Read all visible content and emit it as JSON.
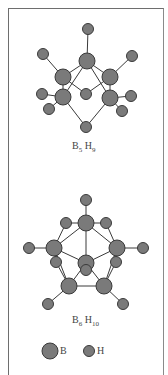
{
  "figure": {
    "molecules": [
      {
        "name": "B5H9",
        "label": {
          "B": "B",
          "B_count": "5",
          "H": "H",
          "H_count": "9"
        },
        "atoms": [
          {
            "el": "H",
            "x": 88,
            "y": 29
          },
          {
            "el": "B",
            "x": 87,
            "y": 61
          },
          {
            "el": "H",
            "x": 43,
            "y": 54
          },
          {
            "el": "H",
            "x": 132,
            "y": 56
          },
          {
            "el": "B",
            "x": 63,
            "y": 77
          },
          {
            "el": "B",
            "x": 110,
            "y": 77
          },
          {
            "el": "H",
            "x": 86,
            "y": 94
          },
          {
            "el": "B",
            "x": 63,
            "y": 97
          },
          {
            "el": "B",
            "x": 110,
            "y": 98
          },
          {
            "el": "H",
            "x": 42,
            "y": 94
          },
          {
            "el": "H",
            "x": 49,
            "y": 109
          },
          {
            "el": "H",
            "x": 131,
            "y": 96
          },
          {
            "el": "H",
            "x": 122,
            "y": 111
          },
          {
            "el": "H",
            "x": 86,
            "y": 127
          }
        ],
        "bonds": [
          [
            0,
            1
          ],
          [
            1,
            4
          ],
          [
            1,
            5
          ],
          [
            1,
            7
          ],
          [
            1,
            8
          ],
          [
            2,
            4
          ],
          [
            3,
            5
          ],
          [
            4,
            6
          ],
          [
            5,
            6
          ],
          [
            4,
            7
          ],
          [
            5,
            8
          ],
          [
            7,
            9
          ],
          [
            7,
            10
          ],
          [
            8,
            11
          ],
          [
            8,
            12
          ],
          [
            7,
            13
          ],
          [
            8,
            13
          ]
        ]
      },
      {
        "name": "B6H10",
        "label": {
          "B": "B",
          "B_count": "6",
          "H": "H",
          "H_count": "10"
        },
        "atoms": [
          {
            "el": "H",
            "x": 86,
            "y": 200
          },
          {
            "el": "B",
            "x": 86,
            "y": 223
          },
          {
            "el": "H",
            "x": 66,
            "y": 223
          },
          {
            "el": "H",
            "x": 106,
            "y": 223
          },
          {
            "el": "B",
            "x": 54,
            "y": 248
          },
          {
            "el": "B",
            "x": 117,
            "y": 248
          },
          {
            "el": "H",
            "x": 29,
            "y": 248
          },
          {
            "el": "H",
            "x": 143,
            "y": 248
          },
          {
            "el": "H",
            "x": 56,
            "y": 262
          },
          {
            "el": "H",
            "x": 116,
            "y": 262
          },
          {
            "el": "B",
            "x": 86,
            "y": 263
          },
          {
            "el": "H",
            "x": 86,
            "y": 270
          },
          {
            "el": "B",
            "x": 69,
            "y": 286
          },
          {
            "el": "B",
            "x": 104,
            "y": 286
          },
          {
            "el": "H",
            "x": 48,
            "y": 304
          },
          {
            "el": "H",
            "x": 123,
            "y": 304
          }
        ],
        "bonds": [
          [
            0,
            1
          ],
          [
            1,
            2
          ],
          [
            1,
            3
          ],
          [
            2,
            4
          ],
          [
            3,
            5
          ],
          [
            1,
            4
          ],
          [
            1,
            5
          ],
          [
            1,
            10
          ],
          [
            4,
            6
          ],
          [
            5,
            7
          ],
          [
            4,
            10
          ],
          [
            5,
            10
          ],
          [
            4,
            12
          ],
          [
            5,
            13
          ],
          [
            12,
            13
          ],
          [
            10,
            12
          ],
          [
            10,
            13
          ],
          [
            4,
            8
          ],
          [
            5,
            9
          ],
          [
            8,
            12
          ],
          [
            9,
            13
          ],
          [
            12,
            14
          ],
          [
            13,
            15
          ]
        ]
      }
    ],
    "legend": [
      {
        "symbol": "B",
        "label": "B",
        "size": "large"
      },
      {
        "symbol": "H",
        "label": "H",
        "size": "small"
      }
    ],
    "colors": {
      "atom_fill": "#7a7a7a",
      "atom_stroke": "#3a3a3a",
      "bond": "#3a3a3a"
    }
  }
}
